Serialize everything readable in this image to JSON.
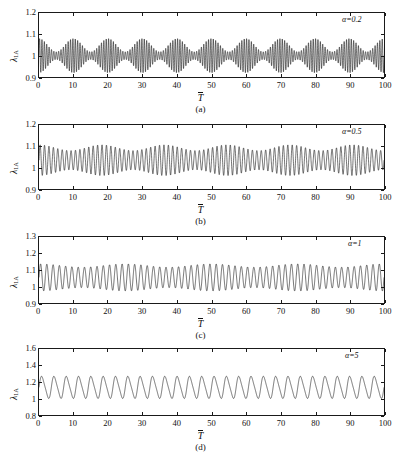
{
  "figure": {
    "ylabel": "λ",
    "ylabel_sub": "1A",
    "xlabel": "T",
    "panels": [
      {
        "caption": "(a)",
        "annotation": "α=0.2",
        "yticks": [
          "0.9",
          "1",
          "1.1",
          "1.2"
        ],
        "xticks": [
          "0",
          "10",
          "20",
          "30",
          "40",
          "50",
          "60",
          "70",
          "80",
          "90",
          "100"
        ]
      },
      {
        "caption": "(b)",
        "annotation": "α=0.5",
        "yticks": [
          "0.9",
          "1",
          "1.1",
          "1.2"
        ],
        "xticks": [
          "0",
          "10",
          "20",
          "30",
          "40",
          "50",
          "60",
          "70",
          "80",
          "90",
          "100"
        ]
      },
      {
        "caption": "(c)",
        "annotation": "α=1",
        "yticks": [
          "0.9",
          "1",
          "1.1",
          "1.2",
          "1.3"
        ],
        "xticks": [
          "0",
          "10",
          "20",
          "30",
          "40",
          "50",
          "60",
          "70",
          "80",
          "90",
          "100"
        ]
      },
      {
        "caption": "(d)",
        "annotation": "α=5",
        "yticks": [
          "0.8",
          "1",
          "1.2",
          "1.4",
          "1.6"
        ],
        "xticks": [
          "0",
          "10",
          "20",
          "30",
          "40",
          "50",
          "60",
          "70",
          "80",
          "90",
          "100"
        ]
      }
    ]
  },
  "chart_data": [
    {
      "type": "line",
      "title": "(a)",
      "annotation": "α=0.2",
      "xlabel": "T̄",
      "ylabel": "λ_1A",
      "xlim": [
        0,
        100
      ],
      "ylim": [
        0.9,
        1.2
      ],
      "xticks": [
        0,
        10,
        20,
        30,
        40,
        50,
        60,
        70,
        80,
        90,
        100
      ],
      "yticks": [
        0.9,
        1.0,
        1.1,
        1.2
      ],
      "grid": false,
      "legend": false,
      "series": [
        {
          "name": "lambda_1A alpha=0.2",
          "description": "Amplitude-modulated (beating) oscillation about 1.0; carrier ~1.45 cycles per unit T, beat envelope ~10 beats over 0-100 (period ~10).",
          "mean": 1.0,
          "envelope_max": 0.08,
          "envelope_min": 0.018,
          "carrier_cycles_per_unit": 1.45,
          "beat_cycles_per_unit": 0.1,
          "peak_value": 1.08,
          "trough_value": 0.92
        }
      ]
    },
    {
      "type": "line",
      "title": "(b)",
      "annotation": "α=0.5",
      "xlabel": "T̄",
      "ylabel": "λ_1A",
      "xlim": [
        0,
        100
      ],
      "ylim": [
        0.9,
        1.2
      ],
      "xticks": [
        0,
        10,
        20,
        30,
        40,
        50,
        60,
        70,
        80,
        90,
        100
      ],
      "yticks": [
        0.9,
        1.0,
        1.1,
        1.2
      ],
      "grid": false,
      "legend": false,
      "series": [
        {
          "name": "lambda_1A alpha=0.5",
          "description": "Quasi-periodic oscillation about 1.035 with mild beating; ~0.78 cycles per unit T.",
          "mean": 1.035,
          "envelope_max": 0.072,
          "envelope_min": 0.045,
          "carrier_cycles_per_unit": 0.78,
          "beat_cycles_per_unit": 0.055,
          "peak_value": 1.105,
          "trough_value": 0.965
        }
      ]
    },
    {
      "type": "line",
      "title": "(c)",
      "annotation": "α=1",
      "xlabel": "T̄",
      "ylabel": "λ_1A",
      "xlim": [
        0,
        100
      ],
      "ylim": [
        0.9,
        1.3
      ],
      "xticks": [
        0,
        10,
        20,
        30,
        40,
        50,
        60,
        70,
        80,
        90,
        100
      ],
      "yticks": [
        0.9,
        1.0,
        1.1,
        1.2,
        1.3
      ],
      "grid": false,
      "legend": false,
      "series": [
        {
          "name": "lambda_1A alpha=1",
          "description": "Periodic oscillation about 1.055 with slight amplitude modulation; ~0.55 cycles per unit T.",
          "mean": 1.055,
          "envelope_max": 0.082,
          "envelope_min": 0.062,
          "carrier_cycles_per_unit": 0.55,
          "beat_cycles_per_unit": 0.04,
          "peak_value": 1.14,
          "trough_value": 0.975
        }
      ]
    },
    {
      "type": "line",
      "title": "(d)",
      "annotation": "α=5",
      "xlabel": "T̄",
      "ylabel": "λ_1A",
      "xlim": [
        0,
        100
      ],
      "ylim": [
        0.8,
        1.6
      ],
      "xticks": [
        0,
        10,
        20,
        30,
        40,
        50,
        60,
        70,
        80,
        90,
        100
      ],
      "yticks": [
        0.8,
        1.0,
        1.2,
        1.4,
        1.6
      ],
      "grid": false,
      "legend": false,
      "series": [
        {
          "name": "lambda_1A alpha=5",
          "description": "Smooth near-sinusoidal oscillation about 1.135, rounded crests and sharper troughs resting on 1.0; ~0.28 cycles per unit T.",
          "mean": 1.135,
          "envelope_max": 0.14,
          "envelope_min": 0.135,
          "carrier_cycles_per_unit": 0.28,
          "beat_cycles_per_unit": 0.0,
          "peak_value": 1.275,
          "trough_value": 0.995
        }
      ]
    }
  ]
}
